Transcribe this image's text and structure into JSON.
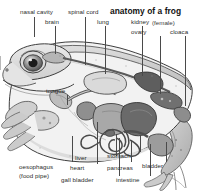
{
  "figure": {
    "title": "anatomy of a frog",
    "subtitle": "(female)",
    "subject": "frog",
    "view": "sagittal cutaway, side view, facing left",
    "style": "grayscale pen-and-ink anatomical illustration",
    "background_color": "#ffffff",
    "ink_color": "#2b2b2b",
    "leader_color": "#4a4a4a"
  },
  "labels": [
    {
      "id": "nasal-cavity",
      "text": "nasal cavity"
    },
    {
      "id": "brain",
      "text": "brain"
    },
    {
      "id": "spinal-cord",
      "text": "spinal cord"
    },
    {
      "id": "lung",
      "text": "lung"
    },
    {
      "id": "kidney",
      "text": "kidney"
    },
    {
      "id": "ovary",
      "text": "ovary"
    },
    {
      "id": "cloaca",
      "text": "cloaca"
    },
    {
      "id": "tongue",
      "text": "tongue"
    },
    {
      "id": "oesophagus",
      "text": "oesophagus"
    },
    {
      "id": "oesophagus-note",
      "text": "(food pipe)"
    },
    {
      "id": "heart",
      "text": "heart"
    },
    {
      "id": "liver",
      "text": "liver"
    },
    {
      "id": "gall-bladder",
      "text": "gall bladder"
    },
    {
      "id": "pancreas",
      "text": "pancreas"
    },
    {
      "id": "stomach",
      "text": "stomach"
    },
    {
      "id": "intestine",
      "text": "intestine"
    },
    {
      "id": "bladder",
      "text": "bladder"
    }
  ]
}
